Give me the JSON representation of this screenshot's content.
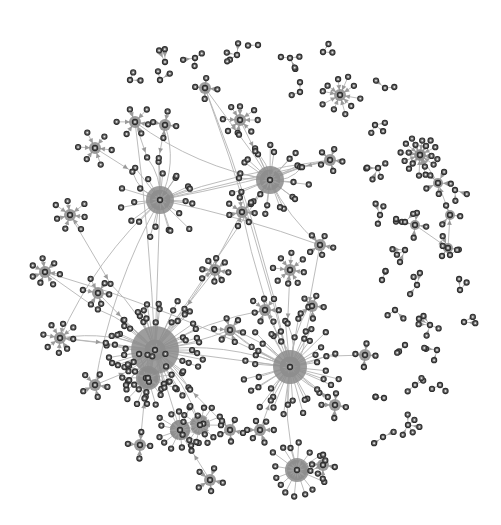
{
  "diagram": {
    "type": "network-graph",
    "directed": true,
    "colors": {
      "background": "#ffffff",
      "edge": "#b4b4b4",
      "arrowhead": "#9a9a9a",
      "node_fill": "#6e6e6e",
      "node_stroke": "#2e2e2e",
      "hub_shading": "#8c8c8c"
    },
    "clusters": [
      {
        "id": "main-hub",
        "role": "largest hub",
        "leaf_count": 60
      },
      {
        "id": "hub-right-center",
        "role": "hub",
        "leaf_count": 40
      },
      {
        "id": "hub-upper-left",
        "role": "hub",
        "leaf_count": 22
      },
      {
        "id": "hub-upper-center",
        "role": "hub",
        "leaf_count": 24
      },
      {
        "id": "hub-lower-center",
        "role": "hub",
        "leaf_count": 16
      },
      {
        "id": "hub-lower-left",
        "role": "hub",
        "leaf_count": 14
      },
      {
        "id": "hub-right-chain",
        "role": "hub",
        "leaf_count": 10
      },
      {
        "id": "small-stars",
        "role": "satellite components",
        "count": 30
      }
    ],
    "labels": []
  }
}
